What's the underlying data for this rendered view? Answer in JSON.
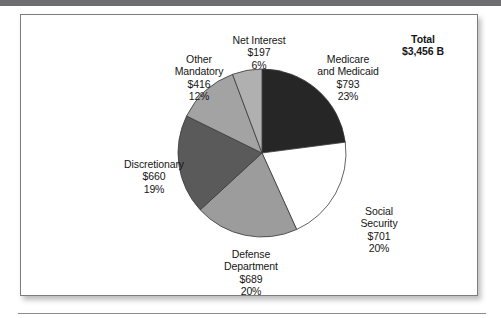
{
  "figure": {
    "total_label": "Total",
    "total_value": "$3,456 B"
  },
  "chart_data": {
    "type": "pie",
    "title": "",
    "subtitle": "",
    "xlabel": "",
    "ylabel": "",
    "units": "billions of dollars",
    "total": 3456,
    "total_display": "$3,456 B",
    "start_angle_deg": 0,
    "direction": "clockwise",
    "legend": "none",
    "labels_position": "outside",
    "categories": [
      "Medicare and Medicaid",
      "Social Security",
      "Defense Department",
      "Discretionary",
      "Other Mandatory",
      "Net Interest"
    ],
    "values": [
      793,
      701,
      689,
      660,
      416,
      197
    ],
    "percentages": [
      23,
      20,
      20,
      19,
      12,
      6
    ],
    "colors": [
      "#262626",
      "#ffffff",
      "#9c9c9c",
      "#5a5a5a",
      "#a3a3a3",
      "#b0b0b0"
    ],
    "slices": [
      {
        "name": "Medicare and Medicaid",
        "line1": "Medicare",
        "line2": "and Medicaid",
        "value_label": "$793",
        "percent_label": "23%",
        "value": 793,
        "percent": 23,
        "color": "#262626"
      },
      {
        "name": "Social Security",
        "line1": "Social",
        "line2": "Security",
        "value_label": "$701",
        "percent_label": "20%",
        "value": 701,
        "percent": 20,
        "color": "#ffffff"
      },
      {
        "name": "Defense Department",
        "line1": "Defense",
        "line2": "Department",
        "value_label": "$689",
        "percent_label": "20%",
        "value": 689,
        "percent": 20,
        "color": "#9c9c9c"
      },
      {
        "name": "Discretionary",
        "line1": "Discretionary",
        "line2": "",
        "value_label": "$660",
        "percent_label": "19%",
        "value": 660,
        "percent": 19,
        "color": "#5a5a5a"
      },
      {
        "name": "Other Mandatory",
        "line1": "Other",
        "line2": "Mandatory",
        "value_label": "$416",
        "percent_label": "12%",
        "value": 416,
        "percent": 12,
        "color": "#a3a3a3"
      },
      {
        "name": "Net Interest",
        "line1": "Net Interest",
        "line2": "",
        "value_label": "$197",
        "percent_label": "6%",
        "value": 197,
        "percent": 6,
        "color": "#b0b0b0"
      }
    ]
  }
}
